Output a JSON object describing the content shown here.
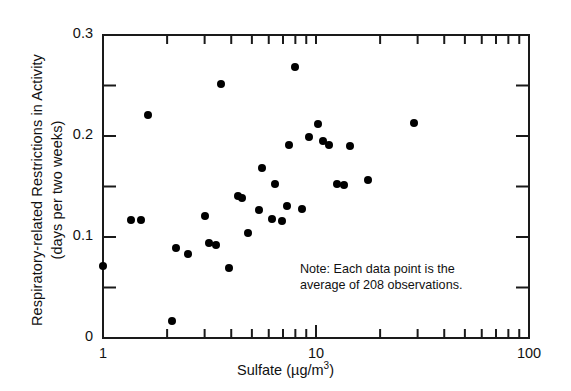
{
  "chart_data": {
    "type": "scatter",
    "title": "",
    "xlabel": "Sulfate (µg/m3)",
    "xlabel_base": "Sulfate (µg/m",
    "xlabel_exponent": "3",
    "xlabel_close": ")",
    "ylabel_line1": "Respiratory-related Restrictions in Activity",
    "ylabel_line2": "(days per two weeks)",
    "xscale": "log",
    "yscale": "linear",
    "xlim": [
      1,
      100
    ],
    "ylim": [
      0,
      0.3
    ],
    "grid": false,
    "legend": null,
    "xticks": [
      1,
      10,
      100
    ],
    "xtick_labels": [
      "1",
      "10",
      "100"
    ],
    "xminor_ticks": [
      2,
      3,
      4,
      5,
      6,
      7,
      8,
      9,
      20,
      30,
      40,
      50,
      60,
      70,
      80,
      90
    ],
    "yticks": [
      0,
      0.1,
      0.2,
      0.3
    ],
    "ytick_labels": [
      "0",
      "0.1",
      "0.2",
      "0.3"
    ],
    "yminor_ticks": [
      0.05,
      0.15,
      0.25
    ],
    "annotation_line1": "Note: Each data point is the",
    "annotation_line2": "average of 208 observations.",
    "marker": "filled-circle",
    "marker_color": "#000000",
    "points": [
      {
        "x": 1.0,
        "y": 0.071
      },
      {
        "x": 1.35,
        "y": 0.117
      },
      {
        "x": 1.5,
        "y": 0.117
      },
      {
        "x": 1.62,
        "y": 0.221
      },
      {
        "x": 2.1,
        "y": 0.017
      },
      {
        "x": 2.2,
        "y": 0.089
      },
      {
        "x": 2.5,
        "y": 0.083
      },
      {
        "x": 3.0,
        "y": 0.121
      },
      {
        "x": 3.15,
        "y": 0.094
      },
      {
        "x": 3.4,
        "y": 0.092
      },
      {
        "x": 3.6,
        "y": 0.251
      },
      {
        "x": 3.9,
        "y": 0.069
      },
      {
        "x": 4.3,
        "y": 0.141
      },
      {
        "x": 4.5,
        "y": 0.139
      },
      {
        "x": 4.8,
        "y": 0.104
      },
      {
        "x": 5.4,
        "y": 0.127
      },
      {
        "x": 5.6,
        "y": 0.168
      },
      {
        "x": 6.2,
        "y": 0.118
      },
      {
        "x": 6.4,
        "y": 0.152
      },
      {
        "x": 6.9,
        "y": 0.116
      },
      {
        "x": 7.3,
        "y": 0.131
      },
      {
        "x": 7.5,
        "y": 0.191
      },
      {
        "x": 8.0,
        "y": 0.268
      },
      {
        "x": 8.6,
        "y": 0.128
      },
      {
        "x": 9.3,
        "y": 0.199
      },
      {
        "x": 10.2,
        "y": 0.212
      },
      {
        "x": 10.8,
        "y": 0.195
      },
      {
        "x": 11.5,
        "y": 0.191
      },
      {
        "x": 12.5,
        "y": 0.152
      },
      {
        "x": 13.5,
        "y": 0.151
      },
      {
        "x": 14.5,
        "y": 0.19
      },
      {
        "x": 17.5,
        "y": 0.156
      },
      {
        "x": 29.0,
        "y": 0.213
      }
    ]
  }
}
